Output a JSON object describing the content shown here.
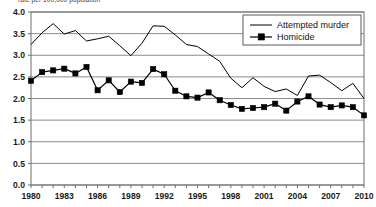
{
  "caption": {
    "text": "rate per 100,000 population",
    "note": "clipped at top edge of screenshot"
  },
  "legend": {
    "position": "top-right-inside",
    "entries": [
      {
        "label": "Attempted murder",
        "marker": "line",
        "color": "#000000"
      },
      {
        "label": "Homicide",
        "marker": "line-square",
        "color": "#000000"
      }
    ]
  },
  "axes": {
    "y_ticks": [
      "4.0",
      "3.5",
      "3.0",
      "2.5",
      "2.0",
      "1.5",
      "1.0",
      "0.5",
      "0.0"
    ],
    "x_ticks": [
      "1980",
      "1983",
      "1986",
      "1989",
      "1992",
      "1995",
      "1998",
      "2001",
      "2004",
      "2007",
      "2010"
    ]
  },
  "colors": {
    "line": "#000000",
    "grid": "#8c8c8c",
    "frame": "#6e6e6e",
    "text": "#1a1a1a",
    "background": "#ffffff"
  },
  "chart_data": {
    "type": "line",
    "title": "",
    "subtitle": "",
    "xlabel": "",
    "ylabel": "rate per 100,000 population",
    "xlim": [
      1980,
      2010
    ],
    "ylim": [
      0.0,
      4.0
    ],
    "ytick_step": 0.5,
    "xtick_step": 3,
    "grid": true,
    "legend_position": "upper right",
    "x": [
      1980,
      1981,
      1982,
      1983,
      1984,
      1985,
      1986,
      1987,
      1988,
      1989,
      1990,
      1991,
      1992,
      1993,
      1994,
      1995,
      1996,
      1997,
      1998,
      1999,
      2000,
      2001,
      2002,
      2003,
      2004,
      2005,
      2006,
      2007,
      2008,
      2009,
      2010
    ],
    "series": [
      {
        "name": "Attempted murder",
        "marker": "none",
        "values": [
          3.25,
          3.52,
          3.73,
          3.49,
          3.57,
          3.33,
          3.38,
          3.44,
          3.22,
          2.99,
          3.28,
          3.68,
          3.67,
          3.47,
          3.25,
          3.2,
          3.03,
          2.86,
          2.47,
          2.25,
          2.48,
          2.28,
          2.16,
          2.22,
          2.07,
          2.52,
          2.54,
          2.37,
          2.18,
          2.35,
          2.0
        ]
      },
      {
        "name": "Homicide",
        "marker": "square",
        "values": [
          2.41,
          2.61,
          2.65,
          2.69,
          2.58,
          2.73,
          2.19,
          2.42,
          2.15,
          2.39,
          2.36,
          2.68,
          2.56,
          2.18,
          2.05,
          2.02,
          2.14,
          1.96,
          1.85,
          1.76,
          1.78,
          1.8,
          1.88,
          1.72,
          1.93,
          2.05,
          1.86,
          1.8,
          1.84,
          1.8,
          1.61
        ]
      }
    ]
  }
}
